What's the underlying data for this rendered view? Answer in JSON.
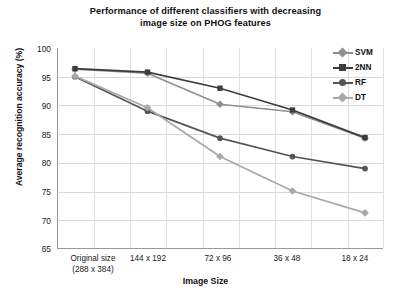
{
  "chart_data": {
    "type": "line",
    "title": "Performance of different classifiers with decreasing image size on PHOG features",
    "title_line1": "Performance of different classifiers with decreasing",
    "title_line2": "image size on PHOG features",
    "xlabel": "Image Size",
    "ylabel": "Average recognition accuracy (%)",
    "categories": [
      "Original size\n(288 x 384)",
      "144 x 192",
      "72 x 96",
      "36 x 48",
      "18 x 24"
    ],
    "category_labels": [
      {
        "line1": "Original size",
        "line2": "(288 x 384)"
      },
      {
        "line1": "144 x 192",
        "line2": ""
      },
      {
        "line1": "72 x 96",
        "line2": ""
      },
      {
        "line1": "36 x 48",
        "line2": ""
      },
      {
        "line1": "18 x 24",
        "line2": ""
      }
    ],
    "ylim": [
      65,
      100
    ],
    "yticks": [
      100,
      95,
      90,
      85,
      80,
      75,
      70,
      65
    ],
    "grid": true,
    "legend_position": "top-right-inside",
    "series": [
      {
        "name": "SVM",
        "values": [
          96.3,
          95.6,
          90.2,
          88.9,
          84.3
        ],
        "color": "#8e8e8e",
        "marker": "diamond"
      },
      {
        "name": "2NN",
        "values": [
          96.4,
          95.8,
          93.0,
          89.2,
          84.4
        ],
        "color": "#3d3d3d",
        "marker": "square"
      },
      {
        "name": "RF",
        "values": [
          95.0,
          89.0,
          84.3,
          81.1,
          79.0
        ],
        "color": "#555555",
        "marker": "circle"
      },
      {
        "name": "DT",
        "values": [
          95.1,
          89.6,
          81.1,
          75.1,
          71.3
        ],
        "color": "#a8a8a8",
        "marker": "diamond"
      }
    ]
  },
  "legend": {
    "entries": [
      {
        "label": "SVM"
      },
      {
        "label": "2NN"
      },
      {
        "label": "RF"
      },
      {
        "label": "DT"
      }
    ]
  }
}
